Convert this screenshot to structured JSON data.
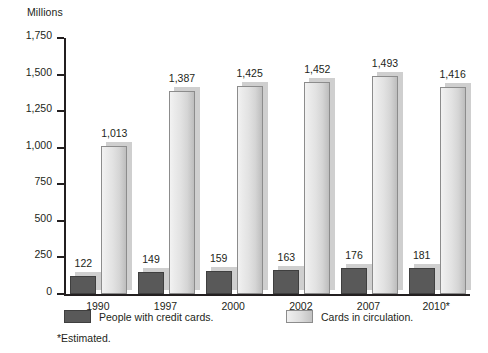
{
  "chart_data": {
    "type": "bar",
    "title": "",
    "axis_title": "Millions",
    "xlabel": "",
    "ylabel": "Millions",
    "ylim": [
      0,
      1750
    ],
    "ytick_step": 250,
    "grid": false,
    "legend_position": "bottom",
    "footnote": "*Estimated.",
    "categories": [
      "1990",
      "1997",
      "2000",
      "2002",
      "2007",
      "2010*"
    ],
    "ytick_labels": [
      "1,750",
      "1,500",
      "1,250",
      "1,000",
      "750",
      "500",
      "250",
      "0"
    ],
    "ytick_values": [
      1750,
      1500,
      1250,
      1000,
      750,
      500,
      250,
      0
    ],
    "series": [
      {
        "name": "People with credit cards.",
        "color": "#595959",
        "values": [
          122,
          149,
          159,
          163,
          176,
          181
        ],
        "labels": [
          "122",
          "149",
          "159",
          "163",
          "176",
          "181"
        ]
      },
      {
        "name": "Cards in circulation.",
        "color": "#dcdcdc",
        "values": [
          1013,
          1387,
          1425,
          1452,
          1493,
          1416
        ],
        "labels": [
          "1,013",
          "1,387",
          "1,425",
          "1,452",
          "1,493",
          "1,416"
        ]
      }
    ]
  },
  "colors": {
    "axis": "#231f20",
    "text": "#231f20",
    "series_dark": "#595959",
    "series_light": "#dcdcdc",
    "shadow": "#cfcfcf",
    "background": "#ffffff"
  }
}
